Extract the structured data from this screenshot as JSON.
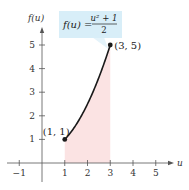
{
  "chart_data": {
    "type": "area",
    "title": "",
    "function": "f(u) = (u^2 + 1)/2",
    "equation_label": {
      "lhs": "f(u) =",
      "numerator": "u² + 1",
      "denominator": "2"
    },
    "xlabel": "u",
    "ylabel": "f(u)",
    "xlim": [
      -1,
      5
    ],
    "ylim": [
      0,
      5
    ],
    "x_ticks": [
      -1,
      1,
      2,
      3,
      4,
      5
    ],
    "x_tick_labels": [
      "−1",
      "1",
      "2",
      "3",
      "4",
      "5"
    ],
    "y_ticks": [
      1,
      2,
      3,
      4,
      5
    ],
    "y_tick_labels": [
      "1",
      "2",
      "3",
      "4",
      "5"
    ],
    "domain": [
      1,
      3
    ],
    "shaded_region": {
      "from": 1,
      "to": 3,
      "under": "curve"
    },
    "points": [
      {
        "x": 1,
        "y": 1,
        "label": "(1, 1)"
      },
      {
        "x": 3,
        "y": 5,
        "label": "(3, 5)"
      }
    ],
    "grid": false,
    "colors": {
      "curve": "#1a1a1a",
      "shade": "#fbe3e3",
      "callout": "#d8eef8",
      "axis": "#555555"
    }
  }
}
